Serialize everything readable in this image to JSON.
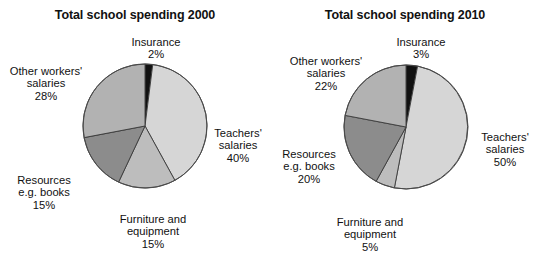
{
  "page": {
    "background_color": "#ffffff",
    "text_color": "#111111"
  },
  "chart_data": [
    {
      "type": "pie",
      "title": "Total school spending 2000",
      "categories": [
        "Insurance",
        "Teachers' salaries",
        "Furniture and equipment",
        "Resources e.g. books",
        "Other workers' salaries"
      ],
      "values": [
        2,
        40,
        15,
        15,
        28
      ],
      "value_suffix": "%",
      "colors": [
        "#111111",
        "#d6d6d6",
        "#bdbdbd",
        "#8c8c8c",
        "#b2b2b2"
      ],
      "start_angle": 0,
      "direction": "clockwise",
      "legend": "labels-outside",
      "grid": false,
      "slices": [
        {
          "name": "Insurance",
          "value": 2,
          "label_line1": "Insurance",
          "label_line2": "2%",
          "color": "#111111"
        },
        {
          "name": "Teachers' salaries",
          "value": 40,
          "label_line1": "Teachers'",
          "label_line2": "salaries",
          "label_line3": "40%",
          "color": "#d6d6d6"
        },
        {
          "name": "Furniture and equipment",
          "value": 15,
          "label_line1": "Furniture and",
          "label_line2": "equipment",
          "label_line3": "15%",
          "color": "#bdbdbd"
        },
        {
          "name": "Resources e.g. books",
          "value": 15,
          "label_line1": "Resources",
          "label_line2": "e.g. books",
          "label_line3": "15%",
          "color": "#8c8c8c"
        },
        {
          "name": "Other workers' salaries",
          "value": 28,
          "label_line1": "Other workers'",
          "label_line2": "salaries",
          "label_line3": "28%",
          "color": "#b2b2b2"
        }
      ]
    },
    {
      "type": "pie",
      "title": "Total school spending 2010",
      "categories": [
        "Insurance",
        "Teachers' salaries",
        "Furniture and equipment",
        "Resources e.g. books",
        "Other workers' salaries"
      ],
      "values": [
        3,
        50,
        5,
        20,
        22
      ],
      "value_suffix": "%",
      "colors": [
        "#111111",
        "#d6d6d6",
        "#bdbdbd",
        "#8c8c8c",
        "#b2b2b2"
      ],
      "start_angle": 0,
      "direction": "clockwise",
      "legend": "labels-outside",
      "grid": false,
      "slices": [
        {
          "name": "Insurance",
          "value": 3,
          "label_line1": "Insurance",
          "label_line2": "3%",
          "color": "#111111"
        },
        {
          "name": "Teachers' salaries",
          "value": 50,
          "label_line1": "Teachers'",
          "label_line2": "salaries",
          "label_line3": "50%",
          "color": "#d6d6d6"
        },
        {
          "name": "Furniture and equipment",
          "value": 5,
          "label_line1": "Furniture and",
          "label_line2": "equipment",
          "label_line3": "5%",
          "color": "#bdbdbd"
        },
        {
          "name": "Resources e.g. books",
          "value": 20,
          "label_line1": "Resources",
          "label_line2": "e.g. books",
          "label_line3": "20%",
          "color": "#8c8c8c"
        },
        {
          "name": "Other workers' salaries",
          "value": 22,
          "label_line1": "Other workers'",
          "label_line2": "salaries",
          "label_line3": "22%",
          "color": "#b2b2b2"
        }
      ]
    }
  ]
}
